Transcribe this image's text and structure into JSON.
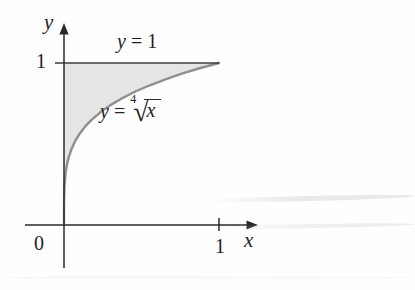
{
  "figure": {
    "background": "#fefefe",
    "region_fill": "#e5e5e5",
    "curve_color": "#8f8f8f",
    "line_color": "#3c3c3c",
    "axis_color": "#2a2a2a",
    "text_color": "#232323"
  },
  "labels": {
    "y_axis": "y",
    "x_axis": "x",
    "origin": "0",
    "y_tick_1": "1",
    "x_tick_1": "1",
    "line_label": {
      "lhs": "y",
      "eq": "=",
      "rhs": "1"
    },
    "curve_label": {
      "lhs": "y",
      "eq": "=",
      "index": "4",
      "radical": "√",
      "radicand": "x"
    }
  },
  "chart_data": {
    "type": "line",
    "title": "",
    "xlabel": "x",
    "ylabel": "y",
    "xlim": [
      -0.25,
      1.25
    ],
    "ylim": [
      -0.27,
      1.25
    ],
    "x_ticks": [
      0,
      1
    ],
    "y_ticks": [
      1
    ],
    "grid": false,
    "legend_position": "none",
    "series": [
      {
        "name": "y = 1",
        "equation": "y = 1",
        "x": [
          0,
          1
        ],
        "y": [
          1,
          1
        ]
      },
      {
        "name": "y = fourth root of x",
        "equation": "y = ⁴√x",
        "x": [
          0,
          5e-05,
          0.0002,
          0.0005,
          0.001,
          0.002,
          0.004,
          0.008,
          0.012,
          0.02,
          0.03,
          0.05,
          0.07,
          0.1,
          0.14,
          0.18,
          0.24,
          0.3,
          0.38,
          0.46,
          0.55,
          0.65,
          0.76,
          0.88,
          1
        ],
        "y": [
          0,
          0.084,
          0.119,
          0.15,
          0.178,
          0.211,
          0.251,
          0.299,
          0.331,
          0.376,
          0.416,
          0.473,
          0.514,
          0.562,
          0.612,
          0.651,
          0.7,
          0.74,
          0.785,
          0.824,
          0.861,
          0.898,
          0.934,
          0.969,
          1
        ]
      }
    ],
    "shaded_region": {
      "description": "Region bounded by the y-axis, the line y = 1, and the curve y = ⁴√x for 0 ≤ x ≤ 1",
      "fill": "#e5e5e5"
    },
    "annotations": [
      {
        "text": "y = 1",
        "x": 0.52,
        "y": 1.12
      },
      {
        "text": "y = ⁴√x",
        "x": 0.55,
        "y": 0.68
      }
    ]
  }
}
